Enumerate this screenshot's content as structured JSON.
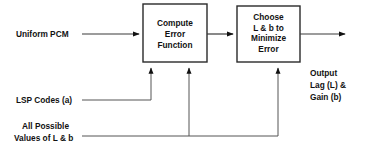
{
  "diagram": {
    "blocks": [
      {
        "id": "compute-error-function",
        "lines": [
          "Compute",
          "Error",
          "Function"
        ],
        "x": 143,
        "y": 4,
        "w": 64,
        "h": 58
      },
      {
        "id": "choose-l-b",
        "lines": [
          "Choose",
          "L & b to",
          "Minimize",
          "Error"
        ],
        "x": 237,
        "y": 6,
        "w": 63,
        "h": 56
      }
    ],
    "labels": [
      {
        "id": "input-uniform-pcm",
        "lines": [
          "Uniform PCM"
        ],
        "x": 16,
        "y": 37,
        "align": "start"
      },
      {
        "id": "input-lsp-codes",
        "lines": [
          "LSP Codes (a)"
        ],
        "x": 16,
        "y": 103,
        "align": "start"
      },
      {
        "id": "input-all-possible-values",
        "lines": [
          "All Possible",
          "Values of L & b"
        ],
        "x": 16,
        "y": 129,
        "align": "start"
      },
      {
        "id": "output-lag-gain",
        "lines": [
          "Output",
          "Lag (L) &",
          "Gain (b)"
        ],
        "x": 310,
        "y": 76,
        "align": "start"
      }
    ],
    "connections": [
      {
        "id": "wire-uniform-pcm-to-compute",
        "from": "Uniform PCM",
        "to": "Compute Error Function",
        "type": "arrow-right"
      },
      {
        "id": "wire-compute-to-choose",
        "from": "Compute Error Function",
        "to": "Choose L & b to Minimize Error",
        "type": "arrow-right"
      },
      {
        "id": "wire-choose-to-output",
        "from": "Choose L & b to Minimize Error",
        "to": "Output Lag (L) & Gain (b)",
        "type": "arrow-right"
      },
      {
        "id": "wire-lsp-to-compute",
        "from": "LSP Codes (a)",
        "to": "Compute Error Function",
        "type": "arrow-up"
      },
      {
        "id": "wire-values-to-compute",
        "from": "All Possible Values of L & b",
        "to": "Compute Error Function",
        "type": "arrow-up"
      },
      {
        "id": "wire-values-to-choose",
        "from": "All Possible Values of L & b",
        "to": "Choose L & b to Minimize Error",
        "type": "arrow-up"
      }
    ],
    "colors": {
      "background": "#ffffff",
      "stroke": "#2a2a2a",
      "wire": "#3a3a3a",
      "text": "#111111"
    }
  }
}
